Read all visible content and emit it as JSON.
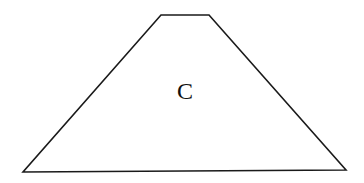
{
  "diagram": {
    "shape": "trapezoid",
    "label": "C",
    "stroke_color": "#1a1a1a",
    "fill_color": "#ffffff",
    "vertices": [
      [
        161,
        15
      ],
      [
        209,
        15
      ],
      [
        346,
        170
      ],
      [
        23,
        172
      ]
    ]
  }
}
